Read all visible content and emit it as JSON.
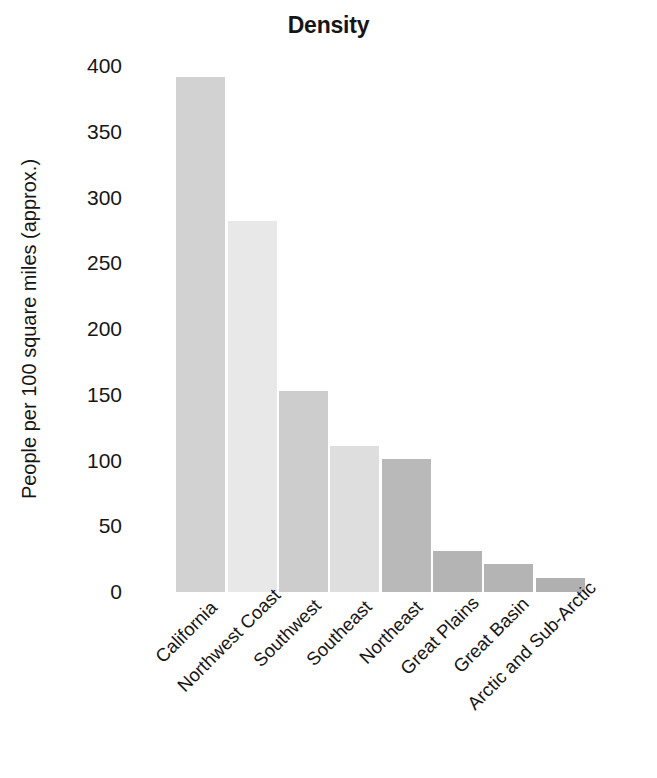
{
  "chart_data": {
    "type": "bar",
    "title": "Density",
    "xlabel": "",
    "ylabel": "People per 100 square miles (approx.)",
    "categories": [
      "California",
      "Northwest Coast",
      "Southwest",
      "Southeast",
      "Northeast",
      "Great Plains",
      "Great Basin",
      "Arctic and Sub-Arctic"
    ],
    "values": [
      392,
      282,
      153,
      111,
      101,
      31,
      21,
      11
    ],
    "ylim": [
      0,
      400
    ],
    "yticks": [
      400,
      350,
      300,
      250,
      200,
      150,
      100,
      50,
      0
    ],
    "ytick_labels": [
      "400",
      "350",
      "300",
      "250",
      "200",
      "150",
      "100",
      "50",
      "0"
    ],
    "grid": false,
    "legend": "none",
    "bar_colors": [
      "#d2d2d2",
      "#e8e8e8",
      "#cdcdcd",
      "#dedede",
      "#b9b9b9",
      "#b4b4b4",
      "#b4b4b4",
      "#b0b0b0"
    ]
  }
}
